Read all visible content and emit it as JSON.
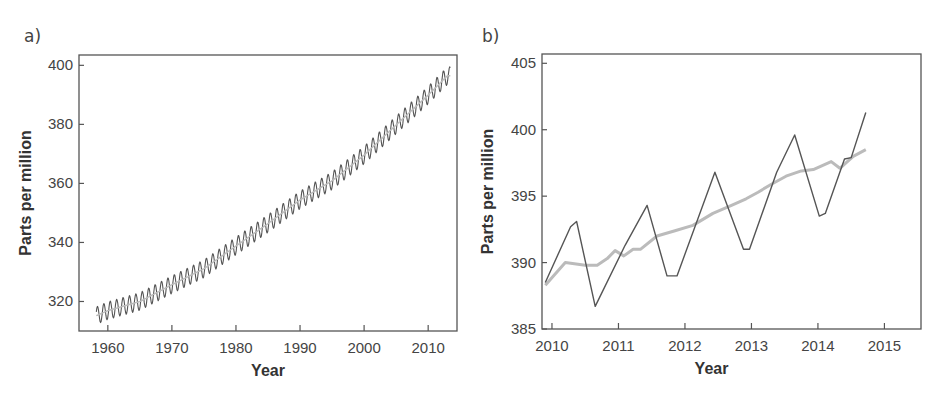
{
  "chart_data": [
    {
      "panel_label": "a)",
      "type": "line",
      "title": "",
      "xlabel": "Year",
      "ylabel": "Parts per million",
      "xlim": [
        1955.5,
        2014.5
      ],
      "ylim": [
        310,
        403.5
      ],
      "x_ticks": [
        1960,
        1970,
        1980,
        1990,
        2000,
        2010
      ],
      "y_ticks": [
        320,
        340,
        360,
        380,
        400
      ],
      "grid": false,
      "line_color": "#555555",
      "description": "Monthly atmospheric CO2 concentration with seasonal oscillation (~6 ppm peak-to-trough), rising from ~315 ppm in 1958 to ~398 ppm in 2013",
      "series": [
        {
          "name": "CO2 trend (annual mean, approx.)",
          "x": [
            1958,
            1960,
            1965,
            1970,
            1975,
            1980,
            1985,
            1990,
            1995,
            2000,
            2005,
            2010,
            2013
          ],
          "values": [
            315,
            316.9,
            320.0,
            325.7,
            331.1,
            338.8,
            346.4,
            354.4,
            360.9,
            369.6,
            379.8,
            389.9,
            396.5
          ]
        }
      ],
      "seasonal_amplitude": 3
    },
    {
      "panel_label": "b)",
      "type": "line",
      "title": "",
      "xlabel": "Year",
      "ylabel": "Parts per million",
      "xlim": [
        2009.85,
        2015.55
      ],
      "ylim": [
        385,
        405.7
      ],
      "x_ticks": [
        2010,
        2011,
        2012,
        2013,
        2014,
        2015
      ],
      "y_ticks": [
        385,
        390,
        395,
        400,
        405
      ],
      "grid": false,
      "series": [
        {
          "name": "Monthly mean",
          "color": "#555555",
          "x": [
            2009.9,
            2010.28,
            2010.37,
            2010.65,
            2011.1,
            2011.43,
            2011.73,
            2011.88,
            2012.45,
            2012.88,
            2012.97,
            2013.38,
            2013.65,
            2014.02,
            2014.11,
            2014.4,
            2014.5,
            2014.72
          ],
          "values": [
            388.5,
            392.7,
            393.1,
            386.7,
            391.3,
            394.3,
            389.0,
            389.0,
            396.8,
            391.0,
            391.0,
            396.8,
            399.6,
            393.5,
            393.7,
            397.8,
            397.9,
            401.3
          ]
        },
        {
          "name": "Seasonally corrected",
          "color": "#bbbbbb",
          "x": [
            2009.9,
            2010.2,
            2010.5,
            2010.68,
            2010.83,
            2010.95,
            2011.08,
            2011.22,
            2011.33,
            2011.58,
            2011.85,
            2012.12,
            2012.42,
            2012.7,
            2012.92,
            2013.1,
            2013.3,
            2013.52,
            2013.75,
            2013.93,
            2014.2,
            2014.33,
            2014.53,
            2014.72
          ],
          "values": [
            388.3,
            390.0,
            389.8,
            389.8,
            390.3,
            390.9,
            390.5,
            391.0,
            391.0,
            392.0,
            392.4,
            392.8,
            393.7,
            394.3,
            394.8,
            395.3,
            395.9,
            396.5,
            396.9,
            397.0,
            397.6,
            397.1,
            398.0,
            398.5
          ]
        }
      ]
    }
  ]
}
